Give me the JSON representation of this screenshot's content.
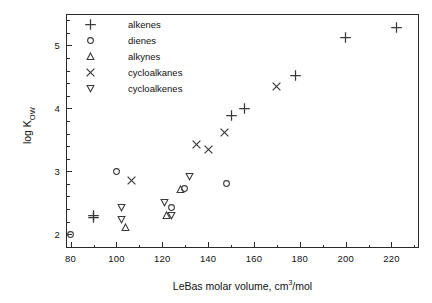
{
  "chart_data": {
    "type": "scatter",
    "title": "",
    "xlabel": "LeBas molar volume, cm3/mol",
    "xlabel_prefix": "LeBas molar volume, cm",
    "xlabel_sup": "3",
    "xlabel_suffix": "/mol",
    "ylabel_prefix": "log K",
    "ylabel_sub": "OW",
    "xlim": [
      78,
      232
    ],
    "ylim": [
      1.78,
      5.5
    ],
    "xticks": [
      80,
      100,
      120,
      140,
      160,
      180,
      200,
      220
    ],
    "xtick_labels": [
      "80",
      "100",
      "120",
      "140",
      "160",
      "180",
      "200",
      "220"
    ],
    "xminor_step": 10,
    "yticks": [
      2,
      3,
      4,
      5
    ],
    "ytick_labels": [
      "2",
      "3",
      "4",
      "5"
    ],
    "yminor_step": 0.2,
    "grid": false,
    "legend_position": "upper-left-inside",
    "series": [
      {
        "name": "alkenes",
        "marker": "plus",
        "points": [
          {
            "x": 90.0,
            "y": 2.3
          },
          {
            "x": 90.0,
            "y": 2.27
          },
          {
            "x": 150.0,
            "y": 3.88
          },
          {
            "x": 156.0,
            "y": 3.99
          },
          {
            "x": 178.0,
            "y": 4.52
          },
          {
            "x": 200.0,
            "y": 5.13
          },
          {
            "x": 222.0,
            "y": 5.28
          }
        ]
      },
      {
        "name": "dienes",
        "marker": "circle",
        "points": [
          {
            "x": 80.0,
            "y": 2.0
          },
          {
            "x": 100.0,
            "y": 2.99
          },
          {
            "x": 124.0,
            "y": 2.43
          },
          {
            "x": 129.5,
            "y": 2.73
          },
          {
            "x": 148.0,
            "y": 2.8
          }
        ]
      },
      {
        "name": "alkynes",
        "marker": "triangle-up",
        "points": [
          {
            "x": 104.0,
            "y": 2.1
          },
          {
            "x": 122.0,
            "y": 2.29
          },
          {
            "x": 128.0,
            "y": 2.71
          }
        ]
      },
      {
        "name": "cycloalkanes",
        "marker": "cross",
        "points": [
          {
            "x": 106.5,
            "y": 2.86
          },
          {
            "x": 135.0,
            "y": 3.43
          },
          {
            "x": 140.0,
            "y": 3.35
          },
          {
            "x": 147.0,
            "y": 3.61
          },
          {
            "x": 170.0,
            "y": 4.35
          }
        ]
      },
      {
        "name": "cycloalkenes",
        "marker": "triangle-down",
        "points": [
          {
            "x": 102.0,
            "y": 2.43
          },
          {
            "x": 102.0,
            "y": 2.23
          },
          {
            "x": 121.0,
            "y": 2.5
          },
          {
            "x": 124.0,
            "y": 2.3
          },
          {
            "x": 132.0,
            "y": 2.92
          }
        ]
      }
    ]
  },
  "legend": {
    "items": [
      {
        "label": "alkenes",
        "marker": "plus"
      },
      {
        "label": "dienes",
        "marker": "circle"
      },
      {
        "label": "alkynes",
        "marker": "triangle-up"
      },
      {
        "label": "cycloalkanes",
        "marker": "cross"
      },
      {
        "label": "cycloalkenes",
        "marker": "triangle-down"
      }
    ]
  },
  "caption": {
    "text": ""
  },
  "colors": {
    "axis": "#2b2b2b",
    "marker": "#3a3a3a",
    "text": "#111111",
    "background": "#ffffff"
  }
}
